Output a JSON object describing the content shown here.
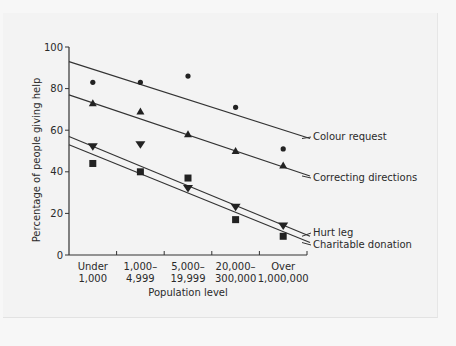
{
  "chart_data": {
    "type": "scatter",
    "title": "",
    "xlabel": "Population level",
    "ylabel": "Percentage of people giving help",
    "ylim": [
      0,
      100
    ],
    "yticks": [
      0,
      20,
      40,
      60,
      80,
      100
    ],
    "grid": false,
    "legend_position": "right, labels at line ends",
    "categories": [
      [
        "Under",
        "1,000"
      ],
      [
        "1,000–",
        "4,999"
      ],
      [
        "5,000–",
        "19,999"
      ],
      [
        "20,000–",
        "300,000"
      ],
      [
        "Over",
        "1,000,000"
      ]
    ],
    "series": [
      {
        "name": "Colour request",
        "marker": "circle",
        "values": [
          83,
          83,
          86,
          71,
          51
        ],
        "trend_line": {
          "start": 93,
          "end": 56
        }
      },
      {
        "name": "Correcting directions",
        "marker": "triangle-up",
        "values": [
          73,
          69,
          58,
          50,
          43
        ],
        "trend_line": {
          "start": 77,
          "end": 38
        }
      },
      {
        "name": "Hurt leg",
        "marker": "triangle-down",
        "values": [
          52,
          53,
          32,
          23,
          14
        ],
        "trend_line": {
          "start": 57,
          "end": 9
        }
      },
      {
        "name": "Charitable donation",
        "marker": "square",
        "values": [
          44,
          40,
          37,
          17,
          9
        ],
        "trend_line": {
          "start": 53,
          "end": 6
        }
      }
    ]
  }
}
